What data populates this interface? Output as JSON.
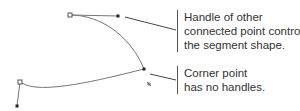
{
  "callouts": [
    {
      "lines": [
        "Handle of other",
        "connected point controls",
        "the segment shape."
      ]
    },
    {
      "lines": [
        "Corner point",
        "has no handles."
      ]
    }
  ],
  "colors": {
    "path": "#777777",
    "anchor": "#222222",
    "leader": "#444444",
    "text": "#333333"
  }
}
